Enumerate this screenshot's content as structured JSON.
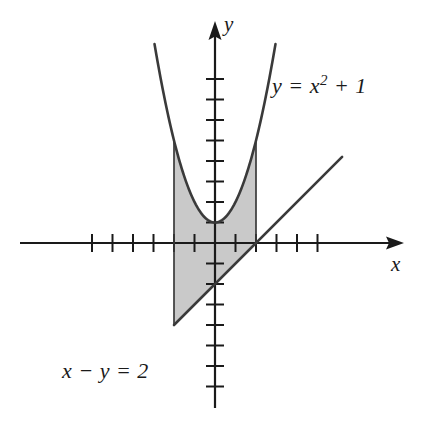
{
  "figure": {
    "kind": "math-graph",
    "background_color": "#ffffff",
    "ink_color": "#1a1a1a",
    "shade_color": "#c9c9c9"
  },
  "axes": {
    "x_axis_label": "x",
    "y_axis_label": "y",
    "origin_px": [
      215,
      243
    ],
    "unit_px": 20.5,
    "x_tick_values": [
      -6,
      -5,
      -4,
      -3,
      -2,
      -1,
      1,
      2,
      3,
      4,
      5
    ],
    "y_tick_values": [
      -7,
      -6,
      -5,
      -4,
      -3,
      -2,
      -1,
      1,
      2,
      3,
      4,
      5,
      6,
      7,
      8
    ],
    "x_range": [
      -7.3,
      9.2
    ],
    "y_range": [
      -8.6,
      10.8
    ],
    "grid": "off",
    "tick_labels_shown": "none"
  },
  "labels": {
    "curve_label": "y = x2 + 1",
    "curve_label_parts": {
      "lhs": "y",
      "equals": "=",
      "base": "x",
      "exponent": "2",
      "plus": "+",
      "constant": "1"
    },
    "line_label": "x − y = 2",
    "line_label_parts": {
      "x": "x",
      "minus": "−",
      "y": "y",
      "equals": "=",
      "constant": "2"
    }
  },
  "chart_data": {
    "type": "line",
    "title": "",
    "xlabel": "x",
    "ylabel": "y",
    "xlim": [
      -7.3,
      9.2
    ],
    "ylim": [
      -8.6,
      10.8
    ],
    "grid": false,
    "legend": "inline annotations",
    "series": [
      {
        "name": "y = x2 + 1",
        "equation": "y = x^2 + 1",
        "kind": "parabola",
        "vertex": [
          0,
          1
        ],
        "drawn_domain": [
          -2.95,
          2.95
        ],
        "points": [
          [
            -2.95,
            9.7
          ],
          [
            -2.5,
            7.25
          ],
          [
            -2.0,
            5.0
          ],
          [
            -1.5,
            3.25
          ],
          [
            -1.0,
            2.0
          ],
          [
            -0.5,
            1.25
          ],
          [
            0,
            1.0
          ],
          [
            0.5,
            1.25
          ],
          [
            1.0,
            2.0
          ],
          [
            1.5,
            3.25
          ],
          [
            2.0,
            5.0
          ],
          [
            2.5,
            7.25
          ],
          [
            2.95,
            9.7
          ]
        ]
      },
      {
        "name": "x − y = 2",
        "equation": "y = x - 2",
        "kind": "line",
        "slope": 1,
        "intercept": -2,
        "drawn_domain": [
          -2.0,
          6.2
        ],
        "points": [
          [
            -2.0,
            -4.0
          ],
          [
            0,
            -2.0
          ],
          [
            2.0,
            0
          ],
          [
            6.2,
            4.2
          ]
        ]
      }
    ],
    "shaded_region": {
      "description": "Region between the parabola y = x^2 + 1 (upper boundary) and the line y = x - 2 (lower boundary), bounded vertically by x = -2 and x = 2",
      "upper_curve": "y = x^2 + 1",
      "lower_curve": "y = x - 2",
      "x_from": -2,
      "x_to": 2,
      "fill_color": "#c9c9c9",
      "corners": [
        [
          -2,
          5
        ],
        [
          2,
          5
        ],
        [
          2,
          0
        ],
        [
          -2,
          -4
        ]
      ]
    },
    "intersections": [
      {
        "label": "line crosses x-axis",
        "point": [
          2,
          0
        ]
      },
      {
        "label": "line crosses y-axis",
        "point": [
          0,
          -2
        ]
      },
      {
        "label": "parabola vertex",
        "point": [
          0,
          1
        ]
      }
    ]
  }
}
